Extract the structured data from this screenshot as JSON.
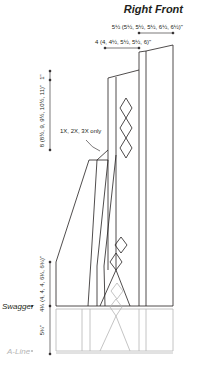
{
  "title": "Right Front",
  "measurements": {
    "top_right_width": "5½ (5½, 5½, 5½, 6½, 6½)\"",
    "shoulder_width": "4 (4, 4½, 5½, 5½, 6)\"",
    "shoulder_drop": "1\"",
    "armhole_depth": "8 (8½, 9, 9½, 10½, 11)\"",
    "lower_body": "4¼ (4, 4, 4, 6¼, 6¾)\"",
    "a_line_extension": "5¾\""
  },
  "annotations": {
    "size_note": "1X, 2X, 3X only"
  },
  "versions": {
    "swagger_label": "Swagger",
    "aline_label": "A-Line"
  },
  "colors": {
    "line": "#231f20",
    "aline": "#b5b5b5"
  }
}
